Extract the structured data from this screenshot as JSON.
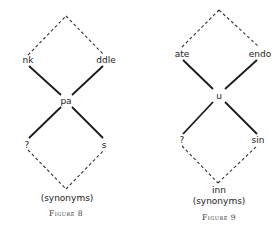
{
  "figures": [
    {
      "caption": "Figure 8",
      "nodes": {
        "top_left": "nk",
        "top_right": "ddle",
        "center": "pa",
        "bottom_left": "?",
        "bottom_right": "s",
        "bottom": "",
        "note": "(synonyms)"
      }
    },
    {
      "caption": "Figure 9",
      "nodes": {
        "top_left": "ate",
        "top_right": "endo",
        "center": "u",
        "bottom_left": "?",
        "bottom_right": "sin",
        "bottom": "inn",
        "note": "(synonyms)"
      }
    }
  ]
}
